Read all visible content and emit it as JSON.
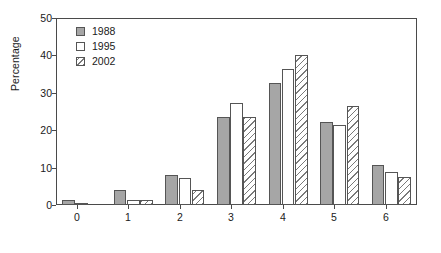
{
  "chart_data": {
    "type": "bar",
    "title": "",
    "xlabel": "",
    "ylabel": "Percentage",
    "categories": [
      "0",
      "1",
      "2",
      "3",
      "4",
      "5",
      "6"
    ],
    "series": [
      {
        "name": "1988",
        "values": [
          1.3,
          4.0,
          8.0,
          23.4,
          32.6,
          22.1,
          10.7
        ]
      },
      {
        "name": "1995",
        "values": [
          0.3,
          1.3,
          7.3,
          27.4,
          36.5,
          21.3,
          8.7
        ]
      },
      {
        "name": "2002",
        "values": [
          0.0,
          1.3,
          4.0,
          23.4,
          40.0,
          26.5,
          7.6
        ]
      }
    ],
    "ylim": [
      0,
      50
    ],
    "yticks": [
      0,
      10,
      20,
      30,
      40,
      50
    ],
    "ytick_labels": [
      "0",
      "10",
      "20",
      "30",
      "40",
      "50"
    ],
    "grid": false,
    "legend_position": "top-left",
    "colors": {
      "series_1988": "#a6a6a6",
      "series_1995": "#ffffff",
      "series_2002": "#ffffff",
      "outline": "#555555",
      "axis": "#4a4a4a",
      "text": "#1a1a1a",
      "background": "#ffffff"
    }
  },
  "legend": {
    "entries": [
      {
        "label": "1988",
        "swatch": "solid-gray-swatch"
      },
      {
        "label": "1995",
        "swatch": "empty-white-swatch"
      },
      {
        "label": "2002",
        "swatch": "diagonal-hatch-swatch"
      }
    ]
  },
  "axes": {
    "y_title": "Percentage",
    "y_tick_labels": [
      "50",
      "40",
      "30",
      "20",
      "10",
      "0"
    ],
    "x_tick_labels": [
      "0",
      "1",
      "2",
      "3",
      "4",
      "5",
      "6"
    ]
  }
}
